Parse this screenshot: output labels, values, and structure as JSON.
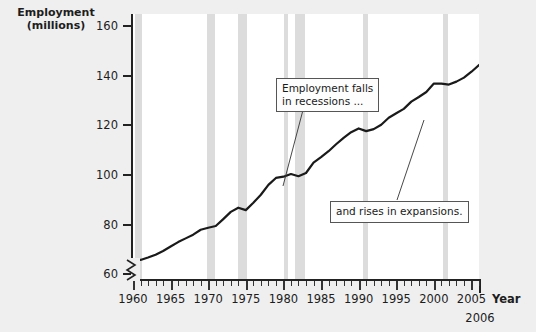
{
  "chart_data": {
    "type": "line",
    "title": "",
    "ylabel": "Employment\n(millions)",
    "xlabel": "Year",
    "x_end_label": "2006",
    "ylim": [
      58,
      165
    ],
    "xlim": [
      1960,
      2006
    ],
    "yticks": [
      60,
      80,
      100,
      120,
      140,
      160
    ],
    "xticks": [
      1960,
      1965,
      1970,
      1975,
      1980,
      1985,
      1990,
      1995,
      2000,
      2005
    ],
    "y_axis_break": true,
    "grid": false,
    "legend": "none",
    "line_color": "#1a1a1a",
    "recession_band_color": "#dcdcdc",
    "plot_background": "#ffffff",
    "figure_background": "#efefef",
    "series": [
      {
        "name": "Employment (millions)",
        "x": [
          1960,
          1961,
          1962,
          1963,
          1964,
          1965,
          1966,
          1967,
          1968,
          1969,
          1970,
          1971,
          1972,
          1973,
          1974,
          1975,
          1976,
          1977,
          1978,
          1979,
          1980,
          1981,
          1982,
          1983,
          1984,
          1985,
          1986,
          1987,
          1988,
          1989,
          1990,
          1991,
          1992,
          1993,
          1994,
          1995,
          1996,
          1997,
          1998,
          1999,
          2000,
          2001,
          2002,
          2003,
          2004,
          2005,
          2006
        ],
        "values": [
          65.8,
          65.7,
          66.7,
          67.8,
          69.3,
          71.1,
          72.9,
          74.4,
          75.9,
          77.9,
          78.7,
          79.4,
          82.2,
          85.1,
          86.8,
          85.8,
          88.8,
          92.0,
          96.0,
          98.8,
          99.3,
          100.4,
          99.5,
          100.8,
          105.0,
          107.2,
          109.6,
          112.4,
          115.0,
          117.3,
          118.8,
          117.7,
          118.5,
          120.3,
          123.1,
          124.9,
          126.7,
          129.6,
          131.5,
          133.5,
          136.9,
          136.9,
          136.5,
          137.7,
          139.3,
          141.7,
          144.4
        ]
      }
    ],
    "recession_bands": [
      {
        "start": 1960.3,
        "end": 1961.2
      },
      {
        "start": 1969.9,
        "end": 1970.9
      },
      {
        "start": 1973.9,
        "end": 1975.2
      },
      {
        "start": 1980.1,
        "end": 1980.6
      },
      {
        "start": 1981.6,
        "end": 1982.9
      },
      {
        "start": 1990.6,
        "end": 1991.2
      },
      {
        "start": 2001.2,
        "end": 2001.9
      }
    ],
    "annotations": [
      {
        "name": "employment-falls-callout",
        "text": "Employment falls\nin recessions ...",
        "leader": {
          "from": [
            303,
            110
          ],
          "to": [
            283,
            186
          ]
        }
      },
      {
        "name": "rises-in-expansions-callout",
        "text": "and rises in expansions.",
        "leader": {
          "from": [
            397,
            200
          ],
          "to": [
            424,
            120
          ]
        }
      }
    ]
  }
}
